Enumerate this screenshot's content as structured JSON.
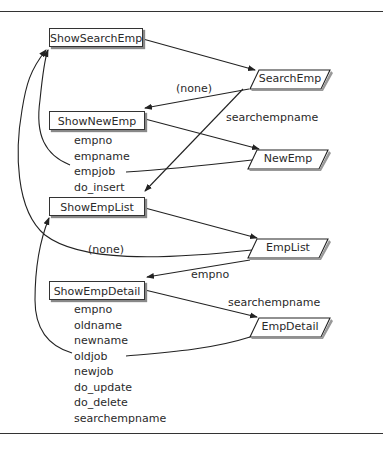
{
  "pages": [
    {
      "id": "ShowSearchEmp",
      "label": "ShowSearchEmp",
      "params": []
    },
    {
      "id": "ShowNewEmp",
      "label": "ShowNewEmp",
      "params": [
        "empno",
        "empname",
        "empjob",
        "do_insert"
      ]
    },
    {
      "id": "ShowEmpList",
      "label": "ShowEmpList",
      "params": []
    },
    {
      "id": "ShowEmpDetail",
      "label": "ShowEmpDetail",
      "params": [
        "empno",
        "oldname",
        "newname",
        "oldjob",
        "newjob",
        "do_update",
        "do_delete",
        "searchempname"
      ]
    }
  ],
  "processes": [
    {
      "id": "SearchEmp",
      "label": "SearchEmp"
    },
    {
      "id": "NewEmp",
      "label": "NewEmp"
    },
    {
      "id": "EmpList",
      "label": "EmpList"
    },
    {
      "id": "EmpDetail",
      "label": "EmpDetail"
    }
  ],
  "edge_labels": {
    "search_to_new": "(none)",
    "search_to_list": "searchempname",
    "list_to_search": "(none)",
    "list_to_detail": "empno",
    "detail_to_empdetail": "searchempname"
  },
  "edges": [
    {
      "from": "ShowSearchEmp",
      "to": "SearchEmp",
      "label": ""
    },
    {
      "from": "SearchEmp",
      "to": "ShowNewEmp",
      "label": "(none)"
    },
    {
      "from": "SearchEmp",
      "to": "ShowEmpList",
      "label": "searchempname"
    },
    {
      "from": "ShowNewEmp",
      "to": "NewEmp",
      "label": ""
    },
    {
      "from": "NewEmp",
      "to": "ShowSearchEmp",
      "label": "empjob"
    },
    {
      "from": "ShowEmpList",
      "to": "EmpList",
      "label": ""
    },
    {
      "from": "EmpList",
      "to": "ShowSearchEmp",
      "label": "(none)"
    },
    {
      "from": "EmpList",
      "to": "ShowEmpDetail",
      "label": "empno"
    },
    {
      "from": "ShowEmpDetail",
      "to": "EmpDetail",
      "label": "searchempname"
    },
    {
      "from": "EmpDetail",
      "to": "ShowEmpList",
      "label": "newjob"
    }
  ]
}
